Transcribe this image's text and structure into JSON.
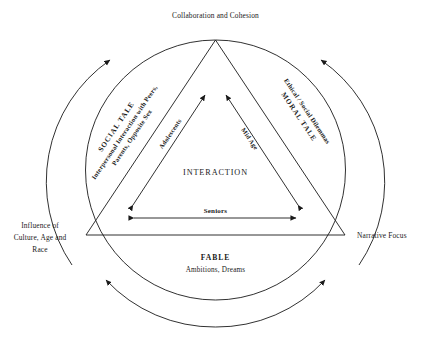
{
  "diagram": {
    "type": "triangle-in-circle-conceptual-diagram",
    "ink_color": "#1a1a1a",
    "background_color": "#ffffff",
    "outer_labels": {
      "top": "Collaboration and Cohesion",
      "left_line1": "Influence of",
      "left_line2": "Culture, Age and",
      "left_line3": "Race",
      "right": "Narrative Focus"
    },
    "sides": {
      "left": {
        "title": "SOCIAL TALE",
        "subtitle_line1": "Interpersonal Interaction with Peers,",
        "subtitle_line2": "Parents, Opposite Sex"
      },
      "right": {
        "title": "MORAL TALE",
        "subtitle": "Ethical / Social Dilemmas"
      },
      "bottom": {
        "title": "FABLE",
        "subtitle": "Ambitions, Dreams"
      }
    },
    "inner": {
      "center": "INTERACTION",
      "left_arrow": "Adolescents",
      "right_arrow": "Mid Age",
      "bottom_arrow": "Seniors"
    }
  }
}
